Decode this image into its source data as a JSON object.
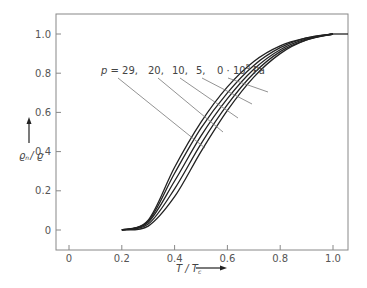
{
  "chart_data": {
    "type": "line",
    "title": "",
    "xlabel": "T / Tc",
    "ylabel": "ρn / ρ",
    "xlim": [
      -0.05,
      1.05
    ],
    "ylim": [
      -0.1,
      1.1
    ],
    "xticks": [
      "0",
      "0.2",
      "0.4",
      "0.6",
      "0.8",
      "1.0"
    ],
    "yticks": [
      "0",
      "0.2",
      "0.4",
      "0.6",
      "0.8",
      "1.0"
    ],
    "grid": false,
    "legend": "inline annotation with leader lines",
    "annotation": "p = 29, 20, 10, 5, 0·10^5 Pa",
    "x": [
      0.2,
      0.3,
      0.4,
      0.5,
      0.6,
      0.7,
      0.8,
      0.9,
      1.0,
      1.05
    ],
    "series": [
      {
        "name": "p = 0·10^5 Pa",
        "values": [
          0,
          0.05,
          0.32,
          0.55,
          0.73,
          0.86,
          0.94,
          0.98,
          1.0,
          1.0
        ]
      },
      {
        "name": "p = 5·10^5 Pa",
        "values": [
          0,
          0.045,
          0.29,
          0.52,
          0.7,
          0.84,
          0.93,
          0.98,
          1.0,
          1.0
        ]
      },
      {
        "name": "p = 10·10^5 Pa",
        "values": [
          0,
          0.04,
          0.25,
          0.48,
          0.67,
          0.82,
          0.92,
          0.975,
          1.0,
          1.0
        ]
      },
      {
        "name": "p = 20·10^5 Pa",
        "values": [
          0,
          0.03,
          0.21,
          0.44,
          0.64,
          0.8,
          0.91,
          0.97,
          1.0,
          1.0
        ]
      },
      {
        "name": "p = 29·10^5 Pa",
        "values": [
          0,
          0.02,
          0.17,
          0.4,
          0.61,
          0.78,
          0.9,
          0.97,
          1.0,
          1.0
        ]
      }
    ]
  },
  "labels": {
    "p_prefix": "p = 29,",
    "p20": "20,",
    "p10": "10,",
    "p5": "5,",
    "p0": "0 · 10",
    "exp": "5",
    "unit": "Pa",
    "ylabel_main": "ϱ",
    "ylabel_sub": "n",
    "ylabel_den": "/ ϱ",
    "xlabel_main": "T / T",
    "xlabel_sub": "c"
  }
}
